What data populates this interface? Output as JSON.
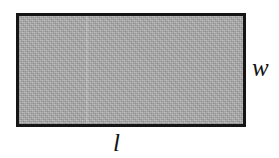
{
  "figure": {
    "name": "rectangle-dimension-diagram",
    "background_color": "#ffffff",
    "shape": {
      "kind": "rectangle",
      "fill_color": "#b2b2b2",
      "fill_texture": "dithered-gray-halftone",
      "border_color": "#151515",
      "border_width_px": 3,
      "x_px": 16,
      "y_px": 13,
      "width_px": 230,
      "height_px": 114
    },
    "labels": {
      "width": "w",
      "length": "l"
    }
  }
}
